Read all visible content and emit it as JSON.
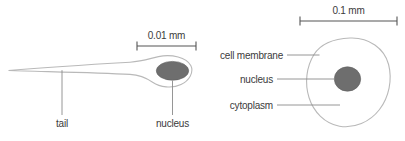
{
  "diagram": {
    "background_color": "#ffffff",
    "outline_color": "#b9b9b9",
    "nucleus_color": "#6e6e6e",
    "leader_color": "#8a8a8a",
    "text_color": "#3b3b3b"
  },
  "sperm": {
    "scale_label": "0.01 mm",
    "labels": {
      "tail": "tail",
      "nucleus": "nucleus"
    }
  },
  "egg": {
    "scale_label": "0.1 mm",
    "labels": {
      "cell_membrane": "cell membrane",
      "nucleus": "nucleus",
      "cytoplasm": "cytoplasm"
    }
  }
}
